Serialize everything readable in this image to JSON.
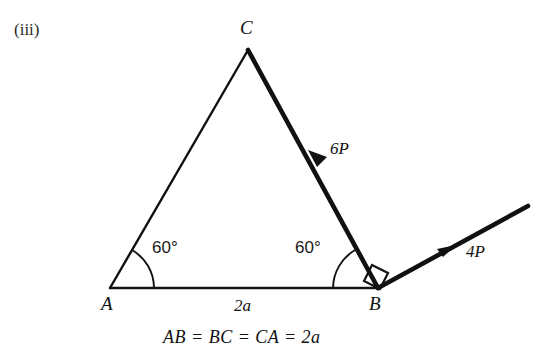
{
  "figure": {
    "enumeration": "(iii)",
    "caption": "AB = BC = CA = 2a",
    "background_color": "#ffffff",
    "ink_color": "#111111"
  },
  "vertices": [
    {
      "name": "C",
      "label": "C",
      "x": 248,
      "y": 50,
      "label_x": 246,
      "label_y": 20
    },
    {
      "name": "A",
      "label": "A",
      "x": 110,
      "y": 288,
      "label_x": 105,
      "label_y": 296
    },
    {
      "name": "B",
      "label": "B",
      "x": 378,
      "y": 288,
      "label_x": 371,
      "label_y": 296
    }
  ],
  "sides": [
    {
      "name": "side-AC",
      "from": "A",
      "to": "C",
      "stroke_width": 2.4,
      "loaded": false
    },
    {
      "name": "side-AB",
      "from": "A",
      "to": "B",
      "stroke_width": 2.4,
      "loaded": false,
      "length_label": "2a"
    },
    {
      "name": "side-CB",
      "from": "C",
      "to": "B",
      "stroke_width": 4.6,
      "loaded": true,
      "force_label": "6P"
    }
  ],
  "angles": [
    {
      "name": "angle-at-A",
      "vertex": "A",
      "value": "60",
      "unit": "°",
      "display": "60°",
      "label_x": 152,
      "label_y": 240,
      "arc_radius": 44
    },
    {
      "name": "angle-at-B",
      "vertex": "B",
      "value": "60",
      "unit": "°",
      "display": "60°",
      "label_x": 297,
      "label_y": 240,
      "arc_radius": 45
    }
  ],
  "right_angle": {
    "name": "right-angle-at-B",
    "vertex": "B",
    "display": "90°",
    "between": [
      "side-CB",
      "force-4P"
    ],
    "size": 18
  },
  "forces": [
    {
      "name": "force-6P",
      "label": "6P",
      "magnitude": 6,
      "symbol": "P",
      "along": "C to B",
      "direction": "down-right",
      "arrow_x": 317,
      "arrow_y": 158,
      "label_x": 329,
      "label_y": 141,
      "stroke_width": 4.6
    },
    {
      "name": "force-4P",
      "label": "4P",
      "magnitude": 4,
      "symbol": "P",
      "along": "B outward",
      "direction": "up-right",
      "arrow_x": 446,
      "arrow_y": 250,
      "tip_x": 528,
      "tip_y": 206,
      "label_x": 466,
      "label_y": 245,
      "stroke_width": 4.6
    }
  ],
  "side_length_label": {
    "name": "side-length-2a",
    "text": "2a",
    "label_x": 234,
    "label_y": 297
  }
}
